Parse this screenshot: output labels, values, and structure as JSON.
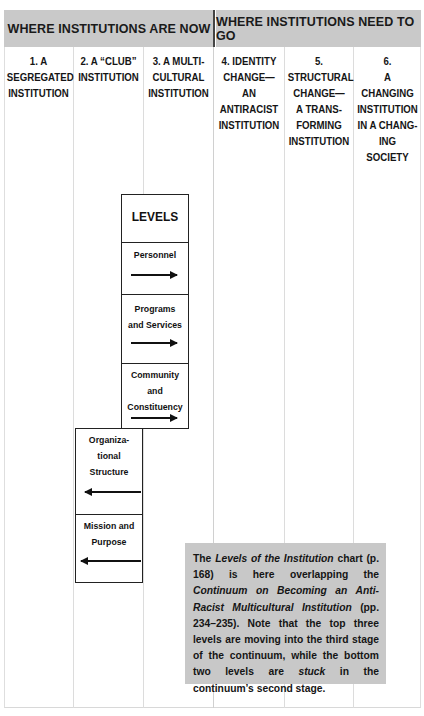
{
  "header": {
    "left_title": "WHERE INSTITUTIONS ARE NOW",
    "right_title": "WHERE INSTITUTIONS NEED TO GO"
  },
  "columns": [
    {
      "lines": [
        "1. A",
        "SEGREGATED",
        "INSTITUTION"
      ]
    },
    {
      "lines": [
        "2. A “CLUB”",
        "INSTITUTION"
      ]
    },
    {
      "lines": [
        "3. A MULTI-",
        "CULTURAL",
        "INSTITUTION"
      ]
    },
    {
      "lines": [
        "4. IDENTITY",
        "CHANGE—",
        "AN",
        "ANTIRACIST",
        "INSTITUTION"
      ]
    },
    {
      "lines": [
        "5.",
        "STRUCTURAL",
        "CHANGE—",
        "A TRANS-",
        "FORMING",
        "INSTITUTION"
      ]
    },
    {
      "lines": [
        "6.",
        "A CHANGING",
        "INSTITUTION",
        "IN A CHANG-",
        "ING SOCIETY"
      ]
    }
  ],
  "levels_box": {
    "title": "LEVELS",
    "items": [
      {
        "lines": [
          "Personnel"
        ],
        "arrow": "right-arrow-icon"
      },
      {
        "lines": [
          "Programs",
          "and Services"
        ],
        "arrow": "right-arrow-icon"
      },
      {
        "lines": [
          "Community",
          "and",
          "Constituency"
        ],
        "arrow": "right-arrow-icon"
      }
    ]
  },
  "stuck_box": {
    "items": [
      {
        "lines": [
          "Organiza-",
          "tional",
          "Structure"
        ],
        "arrow": "left-arrow-icon"
      },
      {
        "lines": [
          "Mission and",
          "Purpose"
        ],
        "arrow": "left-arrow-icon"
      }
    ]
  },
  "note": {
    "p1": "The ",
    "i1": "Levels of the Institution",
    "p2": " chart (p. 168) is here overlapping the ",
    "i2": "Continuum on Becoming an Anti-Racist Multicultural Institution",
    "p3": " (pp. 234–235). Note that the top three levels are moving into the third stage of the continuum, while the bottom two levels are ",
    "i3": "stuck",
    "p4": " in the continuum’s second stage."
  },
  "colors": {
    "header_bg": "#c9c9c9",
    "note_bg": "#c8c8c8",
    "line": "#dcdcdc",
    "box_border": "#222222"
  }
}
